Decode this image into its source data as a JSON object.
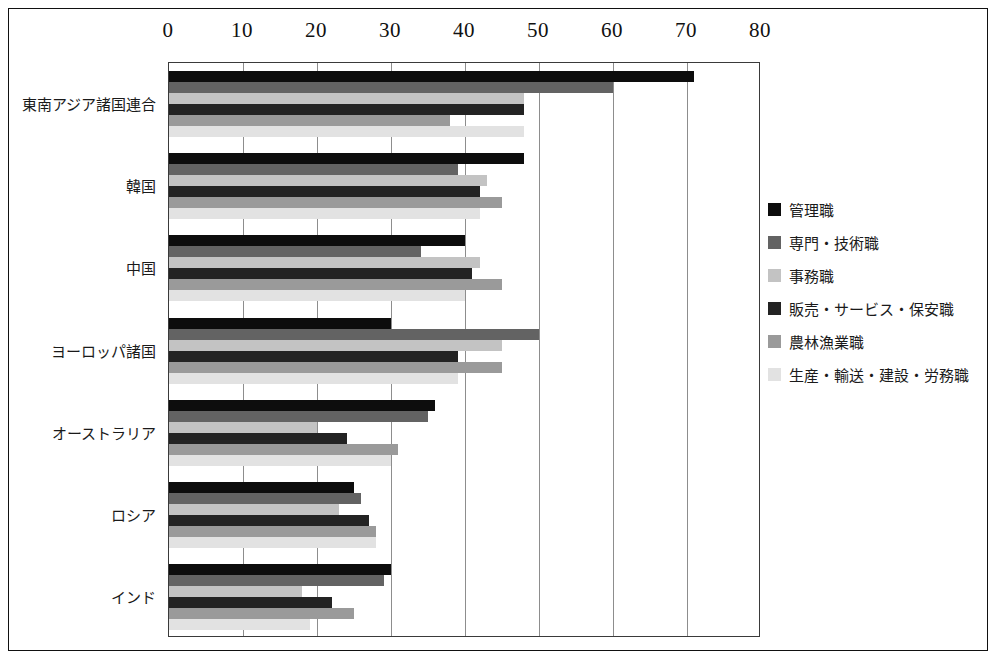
{
  "chart_data": {
    "type": "bar",
    "orientation": "horizontal",
    "title": "",
    "xlabel": "",
    "ylabel": "",
    "xlim": [
      0,
      80
    ],
    "xticks": [
      0,
      10,
      20,
      30,
      40,
      50,
      60,
      70,
      80
    ],
    "grid": true,
    "legend_position": "right",
    "categories": [
      "東南アジア諸国連合",
      "韓国",
      "中国",
      "ヨーロッパ諸国",
      "オーストラリア",
      "ロシア",
      "インド"
    ],
    "series": [
      {
        "name": "管理職",
        "color": "#0d0d0d",
        "values": [
          71,
          48,
          40,
          30,
          36,
          25,
          30
        ]
      },
      {
        "name": "専門・技術職",
        "color": "#636363",
        "values": [
          60,
          39,
          34,
          50,
          35,
          26,
          29
        ]
      },
      {
        "name": "事務職",
        "color": "#c3c3c3",
        "values": [
          48,
          43,
          42,
          45,
          20,
          23,
          18
        ]
      },
      {
        "name": "販売・サービス・保安職",
        "color": "#232323",
        "values": [
          48,
          42,
          41,
          39,
          24,
          27,
          22
        ]
      },
      {
        "name": "農林漁業職",
        "color": "#9a9a9a",
        "values": [
          38,
          45,
          45,
          45,
          31,
          28,
          25
        ]
      },
      {
        "name": "生産・輸送・建設・労務職",
        "color": "#e2e2e2",
        "values": [
          48,
          42,
          40,
          39,
          30,
          28,
          19
        ]
      }
    ]
  }
}
